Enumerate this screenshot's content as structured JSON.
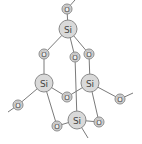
{
  "diagram": {
    "type": "molecular-structure",
    "atoms": [
      {
        "id": "o_top",
        "element": "O",
        "label": "O",
        "x": 67,
        "y": 9
      },
      {
        "id": "si_top",
        "element": "Si",
        "label": "Si",
        "x": 68,
        "y": 29
      },
      {
        "id": "o_ul",
        "element": "O",
        "label": "O",
        "x": 44,
        "y": 54
      },
      {
        "id": "o_um",
        "element": "O",
        "label": "O",
        "x": 75,
        "y": 57
      },
      {
        "id": "o_ur",
        "element": "O",
        "label": "O",
        "x": 89,
        "y": 54
      },
      {
        "id": "si_left",
        "element": "Si",
        "label": "Si",
        "x": 44,
        "y": 83
      },
      {
        "id": "si_right",
        "element": "Si",
        "label": "Si",
        "x": 90,
        "y": 83
      },
      {
        "id": "o_center",
        "element": "O",
        "label": "O",
        "x": 67,
        "y": 97
      },
      {
        "id": "o_far_left",
        "element": "O",
        "label": "O",
        "x": 18,
        "y": 105
      },
      {
        "id": "o_far_right",
        "element": "O",
        "label": "O",
        "x": 120,
        "y": 99
      },
      {
        "id": "si_bottom",
        "element": "Si",
        "label": "Si",
        "x": 77,
        "y": 120
      },
      {
        "id": "o_bl",
        "element": "O",
        "label": "O",
        "x": 57,
        "y": 126
      },
      {
        "id": "o_br",
        "element": "O",
        "label": "O",
        "x": 99,
        "y": 122
      }
    ],
    "bonds": [
      [
        "o_top",
        "si_top"
      ],
      [
        "si_top",
        "o_ul"
      ],
      [
        "si_top",
        "o_um"
      ],
      [
        "si_top",
        "o_ur"
      ],
      [
        "o_ul",
        "si_left"
      ],
      [
        "o_ur",
        "si_right"
      ],
      [
        "o_um",
        "si_bottom"
      ],
      [
        "si_left",
        "o_center"
      ],
      [
        "o_center",
        "si_right"
      ],
      [
        "si_left",
        "o_far_left"
      ],
      [
        "si_right",
        "o_far_right"
      ],
      [
        "si_left",
        "o_bl"
      ],
      [
        "o_bl",
        "si_bottom"
      ],
      [
        "si_right",
        "o_br"
      ],
      [
        "o_br",
        "si_bottom"
      ]
    ],
    "dangling_bonds": [
      {
        "from": "o_top",
        "to": [
          75,
          0
        ]
      },
      {
        "from": "o_far_left",
        "to": [
          8,
          112
        ]
      },
      {
        "from": "o_far_right",
        "to": [
          133,
          93
        ]
      },
      {
        "from": "si_bottom",
        "to": [
          88,
          138
        ]
      }
    ],
    "colors": {
      "si_fill": "#d9d9d9",
      "o_fill": "#dcdcdc",
      "bond": "#7a7a7a",
      "label": "#444444"
    }
  }
}
